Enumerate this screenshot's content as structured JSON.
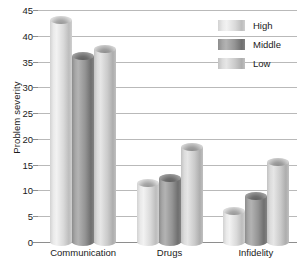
{
  "chart_data": {
    "type": "bar",
    "title": "",
    "xlabel": "",
    "ylabel": "Problem severity",
    "categories": [
      "Communication",
      "Drugs",
      "Infidelity"
    ],
    "series": [
      {
        "name": "High",
        "values": [
          43,
          11.5,
          6
        ],
        "color": "#e3e3e3"
      },
      {
        "name": "Middle",
        "values": [
          36,
          12.5,
          9
        ],
        "color": "#8f8f8f"
      },
      {
        "name": "Low",
        "values": [
          37.5,
          18.5,
          15.5
        ],
        "color": "#d4d4d4"
      }
    ],
    "ylim": [
      0,
      45
    ],
    "ytick_step": 5,
    "yticks": [
      0,
      5,
      10,
      15,
      20,
      25,
      30,
      35,
      40,
      45
    ],
    "grid": true,
    "legend_position": "top-right",
    "bar_style": "cylinder"
  }
}
